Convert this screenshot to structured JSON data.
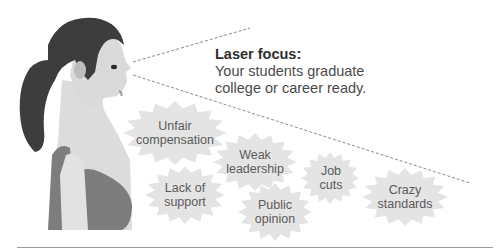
{
  "headline": {
    "title": "Laser focus:",
    "line1": "Your students graduate",
    "line2": "college or career ready."
  },
  "bursts": [
    {
      "id": "unfair-compensation",
      "line1": "Unfair",
      "line2": "compensation",
      "cx": 175,
      "cy": 133,
      "rx": 52,
      "ry": 32
    },
    {
      "id": "weak-leadership",
      "line1": "Weak",
      "line2": "leadership",
      "cx": 255,
      "cy": 162,
      "rx": 42,
      "ry": 29
    },
    {
      "id": "job-cuts",
      "line1": "Job",
      "line2": "cuts",
      "cx": 330,
      "cy": 178,
      "rx": 29,
      "ry": 26
    },
    {
      "id": "lack-of-support",
      "line1": "Lack of",
      "line2": "support",
      "cx": 185,
      "cy": 195,
      "rx": 40,
      "ry": 29
    },
    {
      "id": "public-opinion",
      "line1": "Public",
      "line2": "opinion",
      "cx": 275,
      "cy": 212,
      "rx": 37,
      "ry": 29
    },
    {
      "id": "crazy-standards",
      "line1": "Crazy",
      "line2": "standards",
      "cx": 405,
      "cy": 197,
      "rx": 43,
      "ry": 29
    }
  ],
  "colors": {
    "burst_fill": "#e4e4e4",
    "text": "#5a5a5a",
    "hair": "#3d3d3d",
    "skin": "#d9d9d9",
    "top": "#7d7d7d",
    "dash": "#8a8a8a"
  }
}
